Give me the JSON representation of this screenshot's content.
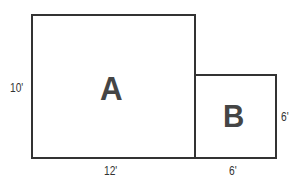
{
  "diagram": {
    "type": "floor-plan-area",
    "colors": {
      "stroke": "#333333",
      "letter": "#454545",
      "label": "#333333",
      "background": "#ffffff"
    },
    "regions": [
      {
        "id": "A",
        "label": "A",
        "width_label": "12'",
        "height_label": "10'"
      },
      {
        "id": "B",
        "label": "B",
        "width_label": "6'",
        "height_label": "6'"
      }
    ],
    "labels": {
      "region_a": "A",
      "region_b": "B",
      "a_height": "10'",
      "a_width": "12'",
      "b_width": "6'",
      "b_height": "6'"
    }
  }
}
